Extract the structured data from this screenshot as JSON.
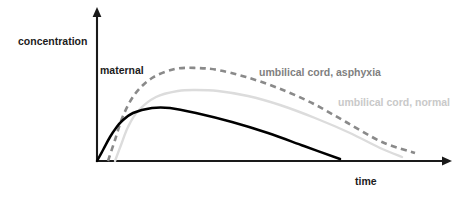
{
  "figure": {
    "background_color": "#ffffff",
    "width": 469,
    "height": 198
  },
  "axes": {
    "y_label": "concentration",
    "x_label": "time",
    "y_axis_name": "concentration-axis",
    "x_axis_name": "time-axis",
    "axis_color": "#1a1a1a",
    "origin": {
      "x": 97,
      "y": 161
    },
    "y_axis_top": 10,
    "x_axis_right": 450,
    "ticks": [],
    "tick_labels": [],
    "grid": false
  },
  "annotations": {
    "maternal": "maternal",
    "asphyxia": "umbilical cord, asphyxia",
    "normal": "umbilical cord, normal"
  },
  "chart_data": {
    "type": "line",
    "title": "",
    "subtitle": "",
    "xlabel": "time",
    "ylabel": "concentration",
    "xlim": [
      0,
      1
    ],
    "ylim": [
      0,
      1
    ],
    "grid": false,
    "legend": "inline-annotations",
    "axis_ticks": "none",
    "series": [
      {
        "name": "maternal",
        "label": "maternal",
        "color": "#000000",
        "style": "solid",
        "linewidth": 2.5,
        "label_position": {
          "x": 100,
          "y": 70
        },
        "peak": {
          "x": 0.19,
          "y": 0.36
        },
        "x": [
          0.0,
          0.02,
          0.05,
          0.08,
          0.11,
          0.15,
          0.19,
          0.24,
          0.31,
          0.4,
          0.5,
          0.6,
          0.69
        ],
        "y": [
          0.0,
          0.07,
          0.17,
          0.25,
          0.31,
          0.35,
          0.36,
          0.35,
          0.32,
          0.26,
          0.19,
          0.11,
          0.02
        ],
        "points_px": [
          [
            97,
            161
          ],
          [
            103,
            150
          ],
          [
            110,
            137
          ],
          [
            116,
            128
          ],
          [
            122,
            121
          ],
          [
            133,
            113
          ],
          [
            152,
            108
          ],
          [
            170,
            108
          ],
          [
            196,
            113
          ],
          [
            232,
            122
          ],
          [
            268,
            133
          ],
          [
            304,
            146
          ],
          [
            340,
            159
          ]
        ]
      },
      {
        "name": "umbilical cord, asphyxia",
        "label": "umbilical cord, asphyxia",
        "color": "#8a8a8a",
        "style": "dashed",
        "linewidth": 2.6,
        "dash_pattern": [
          6,
          4.4
        ],
        "label_position": {
          "x": 259,
          "y": 72
        },
        "peak": {
          "x": 0.29,
          "y": 0.65
        },
        "x": [
          0.03,
          0.06,
          0.09,
          0.13,
          0.18,
          0.24,
          0.29,
          0.35,
          0.43,
          0.52,
          0.62,
          0.72,
          0.82,
          0.9
        ],
        "y": [
          0.0,
          0.14,
          0.3,
          0.45,
          0.56,
          0.63,
          0.65,
          0.64,
          0.6,
          0.53,
          0.43,
          0.31,
          0.17,
          0.06
        ],
        "points_px": [
          [
            108,
            161
          ],
          [
            115,
            140
          ],
          [
            123,
            116
          ],
          [
            135,
            94
          ],
          [
            152,
            78
          ],
          [
            175,
            69
          ],
          [
            197,
            68
          ],
          [
            218,
            70
          ],
          [
            246,
            77
          ],
          [
            278,
            88
          ],
          [
            312,
            103
          ],
          [
            346,
            122
          ],
          [
            382,
            142
          ],
          [
            415,
            153
          ]
        ]
      },
      {
        "name": "umbilical cord, normal",
        "label": "umbilical cord, normal",
        "color": "#dcdcdc",
        "style": "solid",
        "linewidth": 2.4,
        "label_position": {
          "x": 338,
          "y": 102
        },
        "peak": {
          "x": 0.28,
          "y": 0.48
        },
        "x": [
          0.05,
          0.08,
          0.11,
          0.15,
          0.2,
          0.25,
          0.28,
          0.34,
          0.42,
          0.51,
          0.61,
          0.71,
          0.8,
          0.86
        ],
        "y": [
          0.0,
          0.12,
          0.25,
          0.36,
          0.44,
          0.47,
          0.48,
          0.47,
          0.44,
          0.39,
          0.31,
          0.22,
          0.11,
          0.03
        ],
        "points_px": [
          [
            115,
            161
          ],
          [
            121,
            145
          ],
          [
            128,
            127
          ],
          [
            138,
            111
          ],
          [
            156,
            97
          ],
          [
            178,
            91
          ],
          [
            196,
            90
          ],
          [
            218,
            91
          ],
          [
            248,
            96
          ],
          [
            280,
            105
          ],
          [
            315,
            118
          ],
          [
            350,
            133
          ],
          [
            380,
            148
          ],
          [
            402,
            157
          ]
        ]
      }
    ]
  }
}
